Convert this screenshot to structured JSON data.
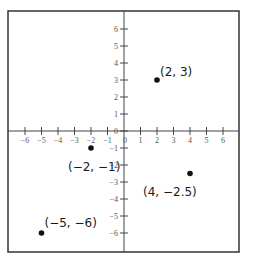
{
  "chart_data": {
    "type": "scatter",
    "title": "",
    "xlabel": "",
    "ylabel": "",
    "xlim": [
      -6,
      6
    ],
    "ylim": [
      -6,
      6
    ],
    "grid": false,
    "x_ticks": [
      -6,
      -5,
      -4,
      -3,
      -2,
      -1,
      0,
      1,
      2,
      3,
      4,
      5,
      6
    ],
    "y_ticks": [
      -6,
      -5,
      -4,
      -3,
      -2,
      -1,
      0,
      1,
      2,
      3,
      4,
      5,
      6
    ],
    "x_tick_labels": [
      "−6",
      "−5",
      "−4",
      "−3",
      "−2",
      "−1",
      "0",
      "1",
      "2",
      "3",
      "4",
      "5",
      "6"
    ],
    "y_tick_labels": [
      "−6",
      "−5",
      "−4",
      "−3",
      "−2",
      "−1",
      "0",
      "1",
      "2",
      "3",
      "4",
      "5",
      "6"
    ],
    "points": [
      {
        "x": 2,
        "y": 3,
        "label": "(2, 3)"
      },
      {
        "x": -2,
        "y": -1,
        "label": "(−2, −1)"
      },
      {
        "x": 4,
        "y": -2.5,
        "label": "(4, −2.5)"
      },
      {
        "x": -5,
        "y": -6,
        "label": "(−5, −6)"
      }
    ]
  },
  "layout": {
    "frame": {
      "left": 8,
      "top": 11,
      "right": 239,
      "bottom": 252
    },
    "origin": {
      "x": 124,
      "y": 131
    },
    "unit_x": 16.5,
    "unit_y": 17,
    "label_offsets": [
      {
        "dx": 3,
        "dy": -4,
        "anchor": "start"
      },
      {
        "dx": -23,
        "dy": 23,
        "anchor": "start"
      },
      {
        "dx": -47,
        "dy": 22,
        "anchor": "start"
      },
      {
        "dx": 3,
        "dy": -6,
        "anchor": "start"
      }
    ],
    "colors": {
      "frame": "#333333",
      "axis": "#444444",
      "point": "#111111"
    }
  }
}
